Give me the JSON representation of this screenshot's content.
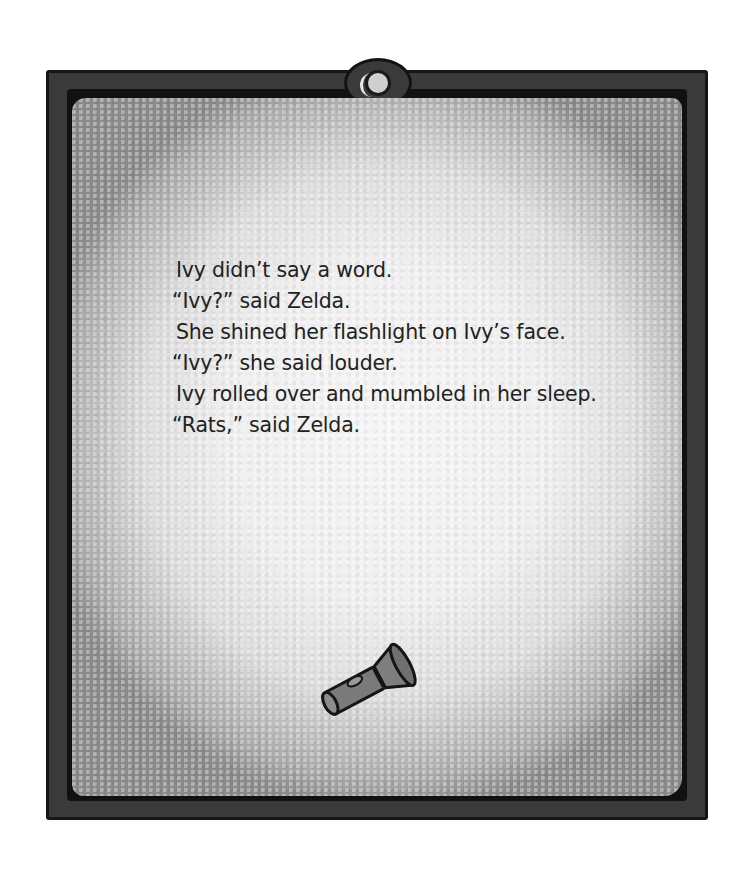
{
  "page": {
    "lines": [
      " Ivy didn’t say a word.",
      "“Ivy?” said Zelda.",
      " She shined her flashlight on Ivy’s face.",
      "“Ivy?” she said louder.",
      " Ivy rolled over and mumbled in her sleep.",
      "“Rats,” said Zelda."
    ]
  },
  "illustration": {
    "frame_icon": "flashlight-lamp-icon",
    "object_icon": "flashlight-icon"
  },
  "colors": {
    "frame": "#3a3a3a",
    "frame_edge": "#161616",
    "panel_light": "#f2f2f2",
    "panel_shadow": "#8a8a8a",
    "text": "#222222"
  }
}
